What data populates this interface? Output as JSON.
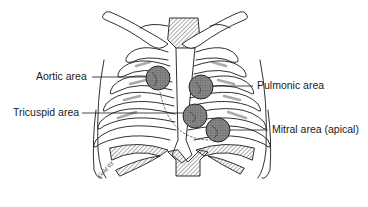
{
  "diagram": {
    "labels": {
      "aortic": "Aortic area",
      "pulmonic": "Pulmonic area",
      "tricuspid": "Tricuspid area",
      "mitral": "Mitral area (apical)"
    },
    "signature": "Gold 93",
    "colors": {
      "stroke": "#1a1a1a",
      "circle_fill": "#7a7a7a",
      "hatch": "#555555",
      "background": "#ffffff"
    },
    "areas": [
      {
        "id": "aortic",
        "cx": 158,
        "cy": 78,
        "r": 12
      },
      {
        "id": "pulmonic",
        "cx": 201,
        "cy": 87,
        "r": 12
      },
      {
        "id": "tricuspid",
        "cx": 195,
        "cy": 116,
        "r": 12
      },
      {
        "id": "mitral",
        "cx": 218,
        "cy": 130,
        "r": 12
      }
    ]
  }
}
